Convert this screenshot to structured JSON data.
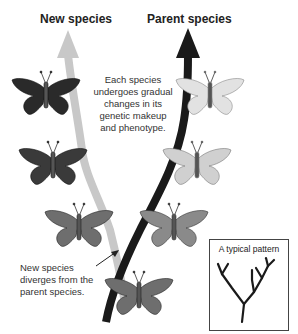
{
  "headings": {
    "new_species": "New species",
    "parent_species": "Parent species"
  },
  "annotations": {
    "gradual_change": [
      "Each species",
      "undergoes gradual",
      "changes in its",
      "genetic makeup",
      "and phenotype."
    ],
    "divergence": [
      "New species",
      "diverges from the",
      "parent species."
    ]
  },
  "inset": {
    "title": "A typical pattern"
  },
  "colors": {
    "new_species_arrow": "#c8c8c8",
    "parent_species_arrow": "#1a1a1a",
    "butterfly_dark": "#2a2a2a",
    "butterfly_mid": "#6e6e6e",
    "butterfly_light": "#d8d8d8"
  }
}
